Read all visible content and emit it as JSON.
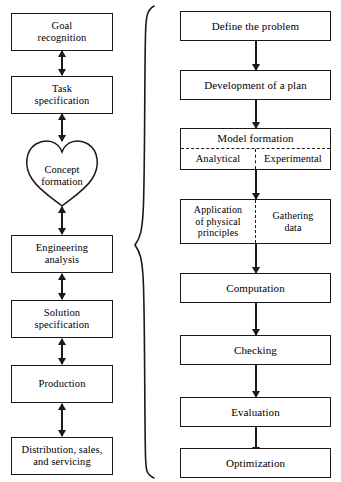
{
  "diagram": {
    "ink_color": "#1a1a1a",
    "background": "#ffffff",
    "left_column": {
      "name": "Design process stages",
      "connector_style": "double-headed-arrow",
      "nodes": [
        {
          "id": "goal-recognition",
          "label": "Goal\nrecognition",
          "shape": "rect"
        },
        {
          "id": "task-specification",
          "label": "Task\nspecification",
          "shape": "rect"
        },
        {
          "id": "concept-formation",
          "label": "Concept\nformation",
          "shape": "heart"
        },
        {
          "id": "engineering-analysis",
          "label": "Engineering\nanalysis",
          "shape": "rect"
        },
        {
          "id": "solution-specification",
          "label": "Solution\nspecification",
          "shape": "rect"
        },
        {
          "id": "production",
          "label": "Production",
          "shape": "rect"
        },
        {
          "id": "distribution-sales",
          "label": "Distribution, sales,\nand servicing",
          "shape": "rect"
        }
      ]
    },
    "right_column": {
      "name": "Engineering analysis steps",
      "connector_style": "single-down-arrow",
      "nodes": [
        {
          "id": "define-the-problem",
          "label": "Define the problem",
          "shape": "rect"
        },
        {
          "id": "development-of-plan",
          "label": "Development of a plan",
          "shape": "rect"
        },
        {
          "id": "model-formation",
          "label": "Model formation",
          "shape": "split",
          "cells": [
            "Analytical",
            "Experimental"
          ]
        },
        {
          "id": "application-gathering",
          "label": "",
          "shape": "split-two",
          "cells": [
            "Application\nof physical\nprinciples",
            "Gathering\ndata"
          ]
        },
        {
          "id": "computation",
          "label": "Computation",
          "shape": "rect"
        },
        {
          "id": "checking",
          "label": "Checking",
          "shape": "rect"
        },
        {
          "id": "evaluation",
          "label": "Evaluation",
          "shape": "rect"
        },
        {
          "id": "optimization",
          "label": "Optimization",
          "shape": "rect"
        }
      ]
    },
    "brace": {
      "name": "expansion-brace",
      "orientation": "left-pointing",
      "links": "engineering-analysis"
    }
  }
}
